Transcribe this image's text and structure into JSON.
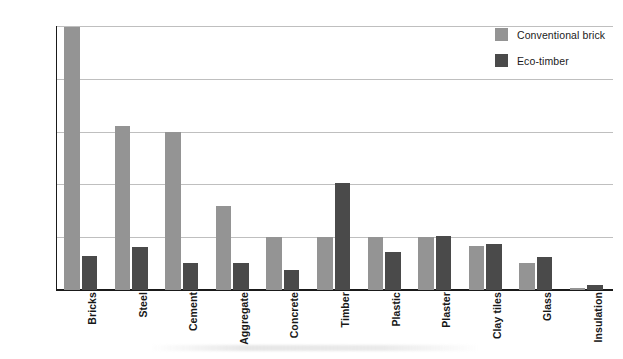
{
  "chart_data": {
    "type": "bar",
    "title": "",
    "xlabel": "",
    "ylabel": "Energy in MWh (1000 kWh)",
    "ylim": [
      0,
      25
    ],
    "yticks": [
      0,
      5,
      10,
      15,
      20,
      25
    ],
    "ytick_labels": [
      "0",
      "5",
      "10",
      "15",
      "20",
      "25"
    ],
    "grid": true,
    "legend_position": "top-right",
    "categories": [
      "Bricks",
      "Steel",
      "Cement",
      "Aggregate",
      "Concrete",
      "Timber",
      "Plastic",
      "Plaster",
      "Clay tiles",
      "Glass",
      "Insulation"
    ],
    "series": [
      {
        "name": "Conventional brick",
        "color": "#949494",
        "values": [
          24.9,
          15.5,
          15.0,
          8.0,
          5.0,
          5.0,
          5.0,
          5.0,
          4.2,
          2.6,
          0.2
        ]
      },
      {
        "name": "Eco-timber",
        "color": "#4a4a4a",
        "values": [
          3.2,
          4.1,
          2.6,
          2.6,
          1.9,
          10.1,
          3.6,
          5.1,
          4.4,
          3.1,
          0.5
        ]
      }
    ]
  },
  "axis": {
    "y_title": "Energy in MWh (1000 kWh)"
  },
  "legend": {
    "items": [
      {
        "label": "Conventional brick",
        "color": "#949494"
      },
      {
        "label": "Eco-timber",
        "color": "#4a4a4a"
      }
    ]
  },
  "colors": {
    "conventional_brick": "#949494",
    "eco_timber": "#4a4a4a",
    "gridline": "#bfbfbf",
    "axis": "#1a1a1a",
    "background": "#ffffff"
  }
}
